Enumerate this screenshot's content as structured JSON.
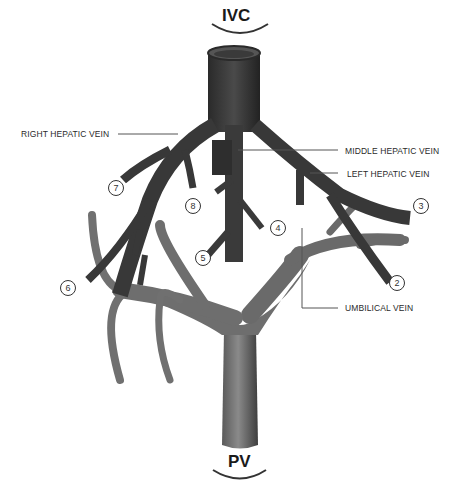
{
  "diagram": {
    "top_label": "IVC",
    "bottom_label": "PV",
    "labels": {
      "right_hepatic_vein": "RIGHT HEPATIC VEIN",
      "middle_hepatic_vein": "MIDDLE HEPATIC VEIN",
      "left_hepatic_vein": "LEFT HEPATIC VEIN",
      "umbilical_vein": "UMBILICAL VEIN"
    },
    "segment_numbers": {
      "s2": "2",
      "s3": "3",
      "s4": "4",
      "s5": "5",
      "s6": "6",
      "s7": "7",
      "s8": "8"
    },
    "colors": {
      "hepatic_veins": "#3a3a3a",
      "portal_vein": "#6e6e6e",
      "leader_line": "#555555",
      "background": "#ffffff"
    }
  }
}
